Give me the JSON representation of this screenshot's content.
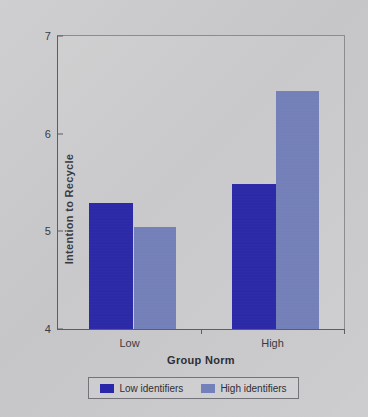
{
  "chart_data": {
    "type": "bar",
    "title": "",
    "xlabel": "Group Norm",
    "ylabel": "Intention to Recycle",
    "categories": [
      "Low",
      "High"
    ],
    "series": [
      {
        "name": "Low identifiers",
        "values": [
          5.29,
          5.48
        ],
        "color": "#2a28a8"
      },
      {
        "name": "High identifiers",
        "values": [
          5.04,
          6.44
        ],
        "color": "#7480ba"
      }
    ],
    "ylim": [
      4,
      7
    ],
    "yticks": [
      7,
      6,
      5,
      4
    ],
    "ytick_labels": [
      "7",
      "6",
      "5",
      "4"
    ],
    "grid": false,
    "legend_position": "bottom"
  },
  "axis": {
    "y_title": "Intention to Recycle",
    "x_title": "Group Norm",
    "y_tick_7": "7",
    "y_tick_6": "6",
    "y_tick_5": "5",
    "y_tick_4": "4",
    "x_tick_low": "Low",
    "x_tick_high": "High"
  },
  "legend": {
    "items": [
      {
        "label": "Low identifiers",
        "color": "#2a28a8"
      },
      {
        "label": "High identifiers",
        "color": "#7480ba"
      }
    ]
  },
  "colors": {
    "background": "#c9c9cb",
    "axis": "#5d5d62",
    "dark_blue": "#2a28a8",
    "light_blue": "#7480ba"
  }
}
